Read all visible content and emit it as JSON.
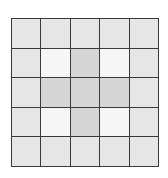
{
  "grid": {
    "rows": 5,
    "cols": 5,
    "colors": {
      "outer": "#e6e6e6",
      "light": "#f7f7f7",
      "dark": "#d6d6d6",
      "border": "#3a3a3a"
    },
    "cells": [
      [
        "outer",
        "outer",
        "outer",
        "outer",
        "outer"
      ],
      [
        "outer",
        "light",
        "dark",
        "light",
        "outer"
      ],
      [
        "outer",
        "dark",
        "dark",
        "dark",
        "outer"
      ],
      [
        "outer",
        "light",
        "dark",
        "light",
        "outer"
      ],
      [
        "outer",
        "outer",
        "outer",
        "outer",
        "outer"
      ]
    ]
  }
}
